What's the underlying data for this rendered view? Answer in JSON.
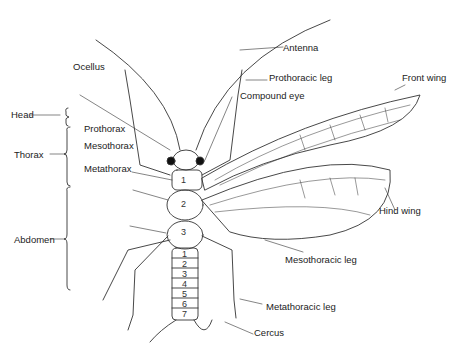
{
  "diagram": {
    "regions": [
      {
        "label": "Head"
      },
      {
        "label": "Thorax"
      },
      {
        "label": "Abdomen"
      }
    ],
    "labels": {
      "antenna": "Antenna",
      "ocellus": "Ocellus",
      "prothoracic_leg": "Prothoracic leg",
      "compound_eye": "Compound eye",
      "front_wing": "Front wing",
      "prothorax": "Prothorax",
      "mesothorax": "Mesothorax",
      "metathorax": "Metathorax",
      "hind_wing": "Hind wing",
      "mesothoracic_leg": "Mesothoracic leg",
      "metathoracic_leg": "Metathoracic leg",
      "cercus": "Cercus"
    },
    "thorax_segments": [
      "1",
      "2",
      "3"
    ],
    "abdomen_segments": [
      "1",
      "2",
      "3",
      "4",
      "5",
      "6",
      "7"
    ],
    "colors": {
      "line": "#333333",
      "text": "#222222",
      "background": "#ffffff"
    }
  }
}
